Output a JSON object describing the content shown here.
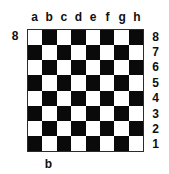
{
  "diagram": {
    "type": "chessboard",
    "colors": {
      "light_square": "#ffffff",
      "dark_square": "#0a0a0a",
      "border": "#2b2b2b",
      "text": "#101010",
      "background": "#ffffff"
    },
    "board": {
      "files": 8,
      "ranks": 8,
      "top_left_square_color": "light",
      "squares": [
        [
          "light",
          "dark",
          "light",
          "dark",
          "light",
          "dark",
          "light",
          "dark"
        ],
        [
          "dark",
          "light",
          "dark",
          "light",
          "dark",
          "light",
          "dark",
          "light"
        ],
        [
          "light",
          "dark",
          "light",
          "dark",
          "light",
          "dark",
          "light",
          "dark"
        ],
        [
          "dark",
          "light",
          "dark",
          "light",
          "dark",
          "light",
          "dark",
          "light"
        ],
        [
          "light",
          "dark",
          "light",
          "dark",
          "light",
          "dark",
          "light",
          "dark"
        ],
        [
          "dark",
          "light",
          "dark",
          "light",
          "dark",
          "light",
          "dark",
          "light"
        ],
        [
          "light",
          "dark",
          "light",
          "dark",
          "light",
          "dark",
          "light",
          "dark"
        ],
        [
          "dark",
          "light",
          "dark",
          "light",
          "dark",
          "light",
          "dark",
          "light"
        ]
      ]
    },
    "labels": {
      "files_top": [
        "a",
        "b",
        "c",
        "d",
        "e",
        "f",
        "g",
        "h"
      ],
      "ranks_right": [
        "8",
        "7",
        "6",
        "5",
        "4",
        "3",
        "2",
        "1"
      ],
      "rank_left": "8",
      "file_bottom": "b"
    }
  }
}
